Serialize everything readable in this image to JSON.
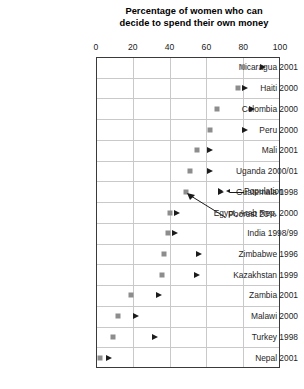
{
  "chart_data": {
    "type": "scatter",
    "title": "Percentage of women who can decide to spend their own money",
    "title_line1": "Percentage of women who can",
    "title_line2": "decide to spend their own money",
    "xlabel": "",
    "ylabel": "",
    "xlim": [
      0,
      100
    ],
    "xticks": [
      0,
      20,
      40,
      60,
      80,
      100
    ],
    "xtick_labels": [
      "0",
      "20",
      "40",
      "60",
      "80",
      "100"
    ],
    "grid": "vertical-and-horizontal",
    "legend_position": "inline-annotation",
    "series": [
      {
        "name": "Poorest 20%",
        "marker": "square",
        "color": "#8d8d8d",
        "values": [
          80,
          77,
          66,
          62,
          55,
          51,
          49,
          40,
          39,
          37,
          36,
          19,
          12,
          9,
          2
        ]
      },
      {
        "name": "Population",
        "marker": "triangle-right",
        "color": "#1c1c1c",
        "values": [
          91,
          81,
          85,
          81,
          62,
          62,
          68,
          44,
          43,
          56,
          55,
          34,
          22,
          32,
          7
        ]
      }
    ],
    "categories": [
      "Nicaragua 2001",
      "Haiti 2000",
      "Colombia 2000",
      "Peru 2000",
      "Mali 2001",
      "Uganda 2000/01",
      "Guatemala 1998",
      "Egypt, Arab Rep. 2000",
      "India 1998/99",
      "Zimbabwe 1996",
      "Kazakhstan 1999",
      "Zambia 2001",
      "Malawi 2000",
      "Turkey 1998",
      "Nepal 2001"
    ],
    "annotations": [
      {
        "name": "population-legend",
        "text": "Population",
        "points_to": "triangle-marker"
      },
      {
        "name": "poorest-legend",
        "text": "Poorest 20%",
        "points_to": "square-marker"
      }
    ],
    "colors": {
      "square_marker": "#8d8d8d",
      "triangle_marker": "#1c1c1c",
      "gridline": "#c9c9c9",
      "frame": "#3a3a3a",
      "background": "#ffffff",
      "text": "#1a1a1a"
    }
  }
}
